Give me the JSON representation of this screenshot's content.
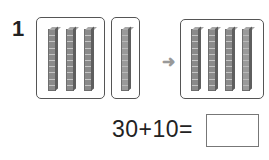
{
  "problem": {
    "number": "1",
    "groups": {
      "first": {
        "rods": 3,
        "label": "three tens rods"
      },
      "second": {
        "rods": 1,
        "label": "one tens rod"
      },
      "result": {
        "rods": 4,
        "label": "four tens rods"
      }
    },
    "arrow_icon": "right-arrow-icon",
    "equation": "30+10=",
    "answer": ""
  }
}
